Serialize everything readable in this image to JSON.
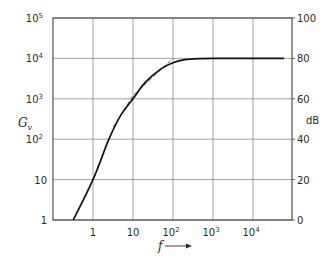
{
  "chart_data": {
    "type": "line",
    "title": "",
    "xlabel": "f",
    "ylabel": "G_v",
    "ylabel_right": "dB",
    "x_scale": "log",
    "y_scale": "log",
    "xlim": [
      0.1,
      100000
    ],
    "ylim": [
      1,
      100000
    ],
    "ylim_right_db": [
      0,
      100
    ],
    "grid": true,
    "legend": null,
    "x_ticks": [
      {
        "value": 1,
        "base": "1",
        "exp": ""
      },
      {
        "value": 10,
        "base": "10",
        "exp": ""
      },
      {
        "value": 100,
        "base": "10",
        "exp": "2"
      },
      {
        "value": 1000,
        "base": "10",
        "exp": "3"
      },
      {
        "value": 10000,
        "base": "10",
        "exp": "4"
      }
    ],
    "y_ticks_left": [
      {
        "value": 1,
        "base": "1",
        "exp": ""
      },
      {
        "value": 10,
        "base": "10",
        "exp": ""
      },
      {
        "value": 100,
        "base": "10",
        "exp": "2"
      },
      {
        "value": 1000,
        "base": "10",
        "exp": "3"
      },
      {
        "value": 10000,
        "base": "10",
        "exp": "4"
      },
      {
        "value": 100000,
        "base": "10",
        "exp": "5"
      }
    ],
    "y_ticks_right": [
      "0",
      "20",
      "40",
      "60",
      "80",
      "100"
    ],
    "series": [
      {
        "name": "G_v (actual response)",
        "style": "solid",
        "points": [
          [
            0.32,
            1
          ],
          [
            1,
            10
          ],
          [
            2.5,
            100
          ],
          [
            5,
            400
          ],
          [
            10,
            1000
          ],
          [
            20,
            2500
          ],
          [
            50,
            5500
          ],
          [
            100,
            7800
          ],
          [
            200,
            9300
          ],
          [
            500,
            9900
          ],
          [
            1000,
            10000
          ],
          [
            10000,
            10000
          ],
          [
            60000,
            10000
          ]
        ]
      },
      {
        "name": "asymptote",
        "style": "dashed",
        "points": [
          [
            3.2,
            200
          ],
          [
            10,
            1200
          ],
          [
            100,
            10000
          ]
        ]
      }
    ],
    "annotations": [
      "f → (arrow indicating increasing frequency)"
    ]
  },
  "labels": {
    "y_left": "G",
    "y_left_sub": "v",
    "y_right": "dB",
    "x": "f"
  }
}
